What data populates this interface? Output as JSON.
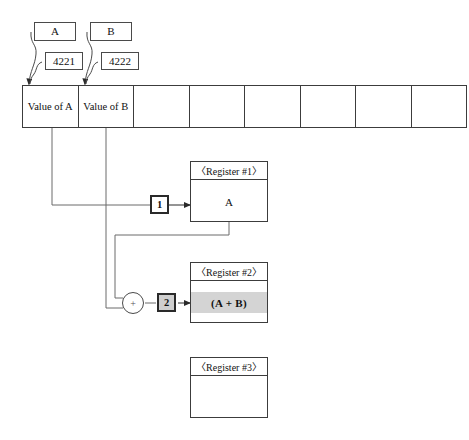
{
  "diagram": {
    "colors": {
      "line": "#3c3c3c",
      "marker_border": "#2a2a2a",
      "highlight_band": "#d4d4d4",
      "step2_fill": "#cfcfcf",
      "background": "#ffffff"
    }
  },
  "callouts": [
    {
      "name": "var-a",
      "label": "A"
    },
    {
      "name": "addr-a",
      "label": "4221"
    },
    {
      "name": "var-b",
      "label": "B"
    },
    {
      "name": "addr-b",
      "label": "4222"
    }
  ],
  "memory": {
    "cells": [
      {
        "label": "Value of A"
      },
      {
        "label": "Value of B"
      },
      {
        "label": ""
      },
      {
        "label": ""
      },
      {
        "label": ""
      },
      {
        "label": ""
      },
      {
        "label": ""
      },
      {
        "label": ""
      }
    ]
  },
  "steps": [
    {
      "name": "step-1",
      "label": "1"
    },
    {
      "name": "step-2",
      "label": "2"
    }
  ],
  "operator": {
    "symbol": "+"
  },
  "registers": [
    {
      "name": "register-1",
      "header": "〈Register #1〉",
      "value": "A",
      "highlighted": false
    },
    {
      "name": "register-2",
      "header": "〈Register #2〉",
      "value": "(A + B)",
      "highlighted": true
    },
    {
      "name": "register-3",
      "header": "〈Register #3〉",
      "value": "",
      "highlighted": false
    }
  ]
}
